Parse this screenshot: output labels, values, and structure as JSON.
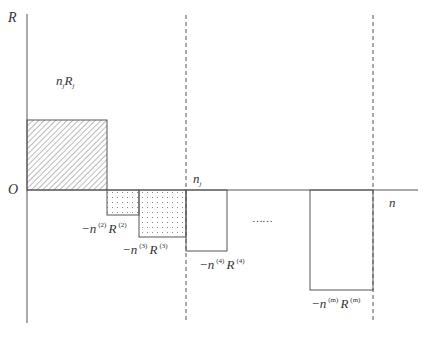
{
  "diagram": {
    "axes": {
      "y_label": "R",
      "x_label": "n",
      "origin_label": "O"
    },
    "marker_label": {
      "base": "n",
      "sub": "j"
    },
    "region_label": {
      "n": "n",
      "n_sub": "j",
      "R": "R",
      "R_sub": "j"
    },
    "ellipsis": "……",
    "bars": [
      {
        "id": "bar-j",
        "fill": "hatched",
        "label": "n_j R_j",
        "x": 27,
        "y": 120,
        "w": 80,
        "h": 70
      },
      {
        "id": "bar-2",
        "fill": "dotted",
        "x": 107,
        "y": 190,
        "w": 32,
        "h": 25,
        "label_parts": {
          "minus": "−n",
          "sup1": "(2)",
          "R": "R",
          "sup2": "(2)"
        }
      },
      {
        "id": "bar-3",
        "fill": "dotted",
        "x": 139,
        "y": 190,
        "w": 47,
        "h": 47,
        "label_parts": {
          "minus": "−n",
          "sup1": "(3)",
          "R": "R",
          "sup2": "(3)"
        }
      },
      {
        "id": "bar-4",
        "fill": "none",
        "x": 186,
        "y": 190,
        "w": 41,
        "h": 61,
        "label_parts": {
          "minus": "−n",
          "sup1": "(4)",
          "R": "R",
          "sup2": "(4)"
        }
      },
      {
        "id": "bar-m",
        "fill": "none",
        "x": 310,
        "y": 190,
        "w": 63,
        "h": 100,
        "label_parts": {
          "minus": "−n",
          "sup1": "(m)",
          "R": "R",
          "sup2": "(m)"
        }
      }
    ],
    "dashed_lines_x": [
      186,
      373
    ],
    "colors": {
      "line": "#555555",
      "hatch": "#777777",
      "dot": "#888888",
      "background": "#ffffff"
    }
  }
}
